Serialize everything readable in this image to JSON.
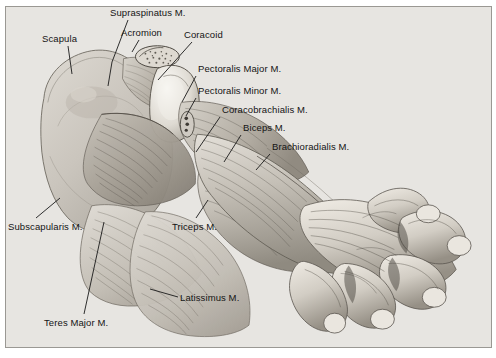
{
  "figure": {
    "kind": "anatomical-illustration",
    "rendering": "grayscale pencil / airbrush halftone plate",
    "background_color": "#e7e5e1",
    "border_color": "#9a9893",
    "label_color": "#141414",
    "leader_color": "#1a1a1a"
  },
  "labels": [
    {
      "id": "supraspinatus",
      "text": "Supraspinatus M.",
      "x": 110,
      "y": 8,
      "anchor": "start",
      "leader": [
        [
          128,
          20
        ],
        [
          112,
          62
        ],
        [
          108,
          86
        ]
      ]
    },
    {
      "id": "acromion",
      "text": "Acromion",
      "x": 121,
      "y": 28,
      "anchor": "start",
      "leader": [
        [
          139,
          40
        ],
        [
          132,
          52
        ]
      ]
    },
    {
      "id": "coracoid",
      "text": "Coracoid",
      "x": 184,
      "y": 30,
      "anchor": "start",
      "leader": [
        [
          192,
          42
        ],
        [
          158,
          80
        ]
      ]
    },
    {
      "id": "scapula",
      "text": "Scapula",
      "x": 42,
      "y": 34,
      "anchor": "start",
      "leader": [
        [
          68,
          46
        ],
        [
          72,
          74
        ]
      ]
    },
    {
      "id": "pectoralis-major",
      "text": "Pectoralis Major M.",
      "x": 198,
      "y": 64,
      "anchor": "start",
      "leader": [
        [
          196,
          76
        ],
        [
          182,
          102
        ]
      ]
    },
    {
      "id": "pectoralis-minor",
      "text": "Pectoralis Minor M.",
      "x": 198,
      "y": 86,
      "anchor": "start",
      "leader": [
        [
          196,
          98
        ],
        [
          186,
          116
        ]
      ]
    },
    {
      "id": "coracobrachialis",
      "text": "Coracobrachialis M.",
      "x": 222,
      "y": 105,
      "anchor": "start",
      "leader": [
        [
          220,
          117
        ],
        [
          196,
          152
        ]
      ]
    },
    {
      "id": "biceps",
      "text": "Biceps M.",
      "x": 243,
      "y": 123,
      "anchor": "start",
      "leader": [
        [
          241,
          135
        ],
        [
          224,
          162
        ]
      ]
    },
    {
      "id": "brachioradialis",
      "text": "Brachioradialis M.",
      "x": 272,
      "y": 142,
      "anchor": "start",
      "leader": [
        [
          270,
          154
        ],
        [
          256,
          170
        ]
      ]
    },
    {
      "id": "subscapularis",
      "text": "Subscapularis M.",
      "x": 8,
      "y": 222,
      "anchor": "start",
      "leader": [
        [
          36,
          218
        ],
        [
          60,
          198
        ]
      ]
    },
    {
      "id": "triceps",
      "text": "Triceps M.",
      "x": 172,
      "y": 222,
      "anchor": "start",
      "leader": [
        [
          196,
          218
        ],
        [
          208,
          200
        ]
      ]
    },
    {
      "id": "latissimus",
      "text": "Latissimus M.",
      "x": 180,
      "y": 293,
      "anchor": "start",
      "leader": [
        [
          178,
          297
        ],
        [
          150,
          289
        ]
      ]
    },
    {
      "id": "teres-major",
      "text": "Teres Major M.",
      "x": 44,
      "y": 318,
      "anchor": "start",
      "leader": [
        [
          84,
          314
        ],
        [
          104,
          222
        ]
      ]
    }
  ]
}
